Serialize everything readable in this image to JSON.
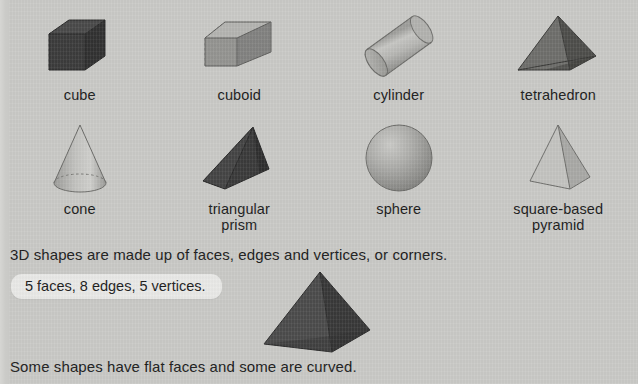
{
  "page": {
    "background_color": "#c9c9c6",
    "text_color": "#1b1b1b"
  },
  "shapes": {
    "row1": [
      {
        "name": "cube",
        "label": "cube",
        "fill": "#3a3a3a",
        "style": "dark"
      },
      {
        "name": "cuboid",
        "label": "cuboid",
        "fill": "#8f8f8c",
        "style": "mid"
      },
      {
        "name": "cylinder",
        "label": "cylinder",
        "fill": "#a6a6a3",
        "style": "light"
      },
      {
        "name": "tetrahedron",
        "label": "tetrahedron",
        "fill": "#646461",
        "style": "mid"
      }
    ],
    "row2": [
      {
        "name": "cone",
        "label": "cone",
        "fill": "#b0b0ad",
        "style": "light"
      },
      {
        "name": "triangular-prism",
        "label": "triangular\nprism",
        "fill": "#3f3f3f",
        "style": "dark"
      },
      {
        "name": "sphere",
        "label": "sphere",
        "fill": "#9a9a97",
        "style": "mid"
      },
      {
        "name": "square-based-pyramid",
        "label": "square-based\npyramid",
        "fill": "#bdbdba",
        "style": "light"
      }
    ]
  },
  "labels": {
    "cube": "cube",
    "cuboid": "cuboid",
    "cylinder": "cylinder",
    "tetrahedron": "tetrahedron",
    "cone": "cone",
    "triangular_prism_line1": "triangular",
    "triangular_prism_line2": "prism",
    "sphere": "sphere",
    "square_pyramid_line1": "square-based",
    "square_pyramid_line2": "pyramid"
  },
  "text": {
    "sentence_main": "3D shapes are made up of faces, edges and vertices, or corners.",
    "callout": "5 faces, 8 edges, 5 vertices.",
    "sentence_bottom": "Some shapes have flat faces and some are curved."
  },
  "big_shape": {
    "name": "square-based-pyramid",
    "fill_left": "#4a4a4a",
    "fill_right": "#383838",
    "describes": "5 faces, 8 edges, 5 vertices."
  }
}
